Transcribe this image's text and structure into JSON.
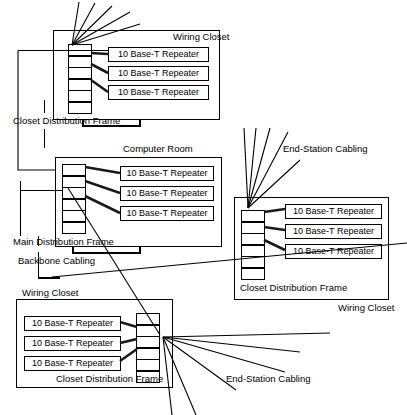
{
  "diagram": {
    "repeater_label": "10 Base-T Repeater",
    "colors": {
      "line": "#000000",
      "box_fill": "#ffffff",
      "cable_thick": "#1a1a1a"
    },
    "labels": {
      "wiring_closet": "Wiring Closet",
      "computer_room": "Computer Room",
      "closet_distribution_frame": "Closet Distribution Frame",
      "main_distribution_frame": "Main Distribution Frame",
      "backbone_cabling": "Backbone Cabling",
      "end_station_cabling": "End-Station Cabling"
    },
    "rooms": [
      {
        "id": "wiring-closet-top",
        "name": "Wiring Closet",
        "frame_name": "Closet Distribution Frame",
        "frame_cells": 6,
        "repeaters": [
          "10 Base-T Repeater",
          "10 Base-T Repeater",
          "10 Base-T Repeater"
        ],
        "end_station_cables": 5
      },
      {
        "id": "computer-room",
        "name": "Computer Room",
        "frame_name": "Main Distribution Frame",
        "frame_cells": 6,
        "repeaters": [
          "10 Base-T Repeater",
          "10 Base-T Repeater",
          "10 Base-T Repeater"
        ],
        "end_station_cables": 0
      },
      {
        "id": "wiring-closet-right",
        "name": "Wiring Closet",
        "frame_name": "Closet Distribution Frame",
        "frame_cells": 6,
        "repeaters": [
          "10 Base-T Repeater",
          "10 Base-T Repeater",
          "10 Base-T Repeater"
        ],
        "end_station_cables": 5
      },
      {
        "id": "wiring-closet-bottom",
        "name": "Wiring Closet",
        "frame_name": "Closet Distribution Frame",
        "frame_cells": 6,
        "repeaters": [
          "10 Base-T Repeater",
          "10 Base-T Repeater",
          "10 Base-T Repeater"
        ],
        "end_station_cables": 6
      }
    ],
    "annotations": [
      {
        "id": "cdf-top",
        "text": "Closet Distribution Frame"
      },
      {
        "id": "mdf",
        "text": "Main Distribution Frame"
      },
      {
        "id": "backbone",
        "text": "Backbone Cabling"
      },
      {
        "id": "esc-right",
        "text": "End-Station Cabling"
      },
      {
        "id": "esc-bottom",
        "text": "End-Station Cabling"
      },
      {
        "id": "cdf-right",
        "text": "Closet Distribution Frame"
      },
      {
        "id": "cdf-bottom",
        "text": "Closet Distribution Frame"
      },
      {
        "id": "wc-right",
        "text": "Wiring Closet"
      },
      {
        "id": "wc-bottom",
        "text": "Wiring Closet"
      },
      {
        "id": "wc-top",
        "text": "Wiring Closet"
      },
      {
        "id": "cr",
        "text": "Computer Room"
      }
    ]
  }
}
